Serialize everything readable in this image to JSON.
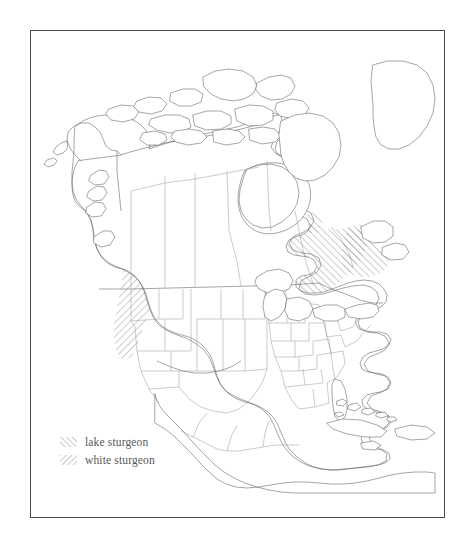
{
  "figure": {
    "kind": "distribution-map",
    "region": "North America",
    "background_color": "#ffffff",
    "frame_color": "#4a4a4a",
    "coastline_color": "#5b5b5b",
    "state_border_color": "#8e8e8e",
    "hatch_color": "#9a9a9a"
  },
  "legend": {
    "items": [
      {
        "id": "lake-sturgeon",
        "label": "lake sturgeon",
        "swatch_icon": "forward-hatch-swatch",
        "hatch_direction": "forward-slash",
        "hatch_color": "#9a9a9a"
      },
      {
        "id": "white-sturgeon",
        "label": "white sturgeon",
        "swatch_icon": "back-hatch-swatch",
        "hatch_direction": "back-slash",
        "hatch_color": "#9a9a9a"
      }
    ]
  },
  "ranges": [
    {
      "id": "lake-sturgeon",
      "label": "lake sturgeon",
      "description": "Great Lakes basin, Hudson Bay drainage, upper Mississippi and Saint Lawrence river systems",
      "hatch_direction": "forward-slash"
    },
    {
      "id": "white-sturgeon",
      "label": "white sturgeon",
      "description": "Pacific coast from British Columbia south through Washington, Oregon and northern California; Columbia and Fraser river systems",
      "hatch_direction": "back-slash"
    }
  ],
  "map_features": {
    "landmasses": [
      "North American mainland",
      "Greenland edge",
      "Canadian Arctic Archipelago",
      "Baffin Island",
      "Newfoundland",
      "Vancouver Island",
      "Cuba",
      "Hispaniola",
      "Jamaica",
      "Puerto Rico",
      "Bahamas"
    ],
    "water_bodies": [
      "Hudson Bay",
      "Great Lakes",
      "Gulf of Mexico",
      "Caribbean Sea",
      "Great Slave Lake",
      "Great Bear Lake",
      "Lake Winnipeg"
    ],
    "boundaries_shown": [
      "United States state boundaries",
      "Canadian provincial boundaries",
      "Mexican state boundaries",
      "International borders"
    ]
  }
}
